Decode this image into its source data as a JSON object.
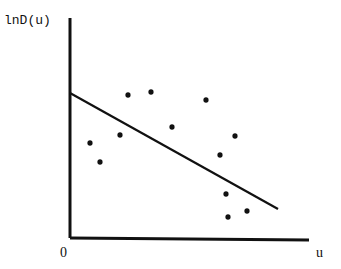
{
  "chart_data": {
    "type": "scatter",
    "title": "",
    "xlabel": "u",
    "ylabel": "lnD(u)",
    "origin_label": "0",
    "grid": false,
    "legend": null,
    "points_px": [
      [
        128,
        95
      ],
      [
        151,
        92
      ],
      [
        206,
        100
      ],
      [
        172,
        127
      ],
      [
        120,
        135
      ],
      [
        90,
        143
      ],
      [
        100,
        162
      ],
      [
        235,
        136
      ],
      [
        220,
        155
      ],
      [
        226,
        194
      ],
      [
        247,
        211
      ],
      [
        228,
        217
      ]
    ],
    "fit_line_px": [
      [
        70,
        93
      ],
      [
        278,
        209
      ]
    ],
    "axes_px": {
      "origin": [
        70,
        238
      ],
      "x_end": [
        309,
        238
      ],
      "y_top": [
        70,
        18
      ]
    }
  }
}
